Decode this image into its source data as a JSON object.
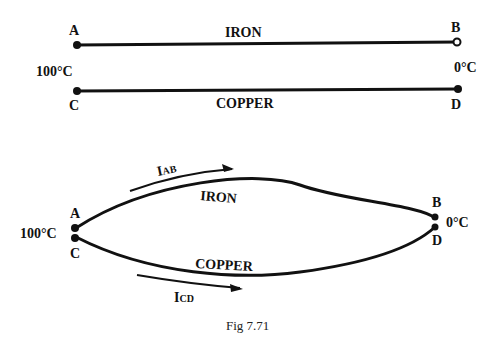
{
  "top": {
    "point_a": "A",
    "point_b": "B",
    "point_c": "C",
    "point_d": "D",
    "wire_iron": "IRON",
    "wire_copper": "COPPER",
    "temp_hot": "100°C",
    "temp_cold": "0°C"
  },
  "bottom": {
    "point_a": "A",
    "point_b": "B",
    "point_c": "C",
    "point_d": "D",
    "wire_iron": "IRON",
    "wire_copper": "COPPER",
    "temp_hot": "100°C",
    "temp_cold": "0°C",
    "current_ab": {
      "main": "I",
      "sub": "AB"
    },
    "current_cd": {
      "main": "I",
      "sub": "CD"
    }
  },
  "caption": "Fig 7.71"
}
